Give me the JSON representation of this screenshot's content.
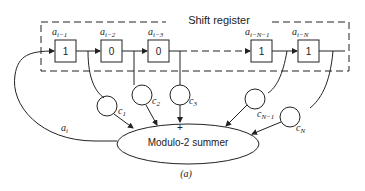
{
  "diagram": {
    "title": "Shift register",
    "caption": "(a)",
    "summer_label": "Modulo-2 summer",
    "summer_sign": "+",
    "feedback_label": "a",
    "feedback_sub": "i",
    "cells": [
      {
        "label": "a",
        "sub": "i−1",
        "value": "1"
      },
      {
        "label": "a",
        "sub": "i−2",
        "value": "0"
      },
      {
        "label": "a",
        "sub": "i−3",
        "value": "0"
      },
      {
        "label": "a",
        "sub": "i−N−1",
        "value": "1"
      },
      {
        "label": "a",
        "sub": "i−N",
        "value": "1"
      }
    ],
    "taps": [
      {
        "label": "c",
        "sub": "1"
      },
      {
        "label": "c",
        "sub": "2"
      },
      {
        "label": "c",
        "sub": "3"
      },
      {
        "label": "c",
        "sub": "N−1"
      },
      {
        "label": "c",
        "sub": "N"
      }
    ],
    "colors": {
      "line": "#222222",
      "background": "#ffffff"
    }
  }
}
